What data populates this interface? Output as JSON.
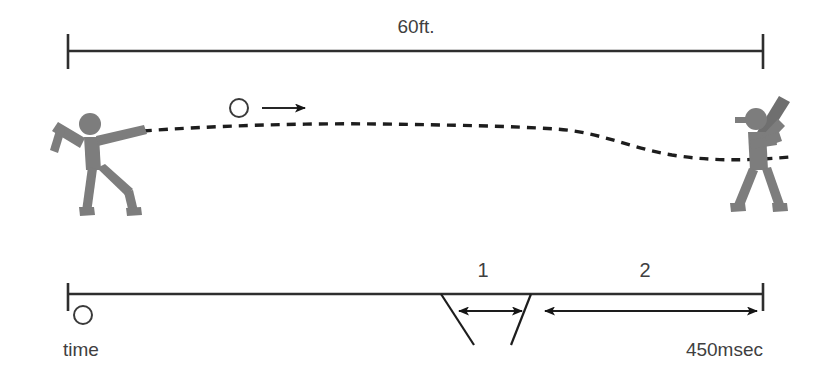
{
  "diagram": {
    "title_alt": "Baseball pitch distance and reaction time diagram",
    "colors": {
      "figure_gray": "#7d7d7d",
      "line_black": "#2e2e2e",
      "text_gray": "#3f3f3f",
      "background": "#ffffff"
    },
    "distance_scale": {
      "label": "60ft.",
      "start_tick": "",
      "end_tick": ""
    },
    "scene": {
      "pitcher_name": "pitcher",
      "batter_name": "batter",
      "ball_name": "baseball",
      "motion_arrow_name": "ball-direction-arrow",
      "trajectory_name": "ball-trajectory"
    },
    "timeline": {
      "start_marker": "",
      "start_label": "time",
      "end_label": "450msec",
      "segments": [
        {
          "id": "1",
          "label": "1"
        },
        {
          "id": "2",
          "label": "2"
        }
      ]
    }
  }
}
